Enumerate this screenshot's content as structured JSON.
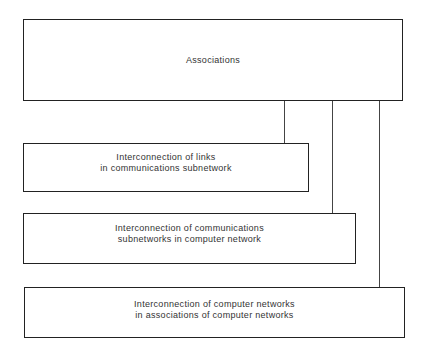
{
  "diagram": {
    "top_box": {
      "label": "Associations"
    },
    "boxes": [
      {
        "label": "Interconnection of links\nin communications subnetwork"
      },
      {
        "label": "Interconnection of communications\nsubnetworks in computer network"
      },
      {
        "label": "Interconnection of computer networks\nin associations of computer networks"
      }
    ]
  }
}
